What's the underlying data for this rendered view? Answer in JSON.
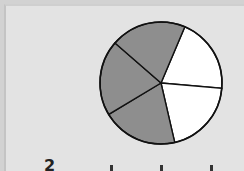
{
  "chart_data": {
    "type": "pie",
    "title": "",
    "total_parts": 5,
    "shaded_parts": 3,
    "fraction_shaded": "3/5",
    "slices": [
      {
        "label": "part 1",
        "value": 1,
        "shaded": false,
        "color": "#ffffff"
      },
      {
        "label": "part 2",
        "value": 1,
        "shaded": false,
        "color": "#ffffff"
      },
      {
        "label": "part 3",
        "value": 1,
        "shaded": true,
        "color": "#8e8e8e"
      },
      {
        "label": "part 4",
        "value": 1,
        "shaded": true,
        "color": "#8e8e8e"
      },
      {
        "label": "part 5",
        "value": 1,
        "shaded": true,
        "color": "#8e8e8e"
      }
    ],
    "legend": null
  },
  "caption": {
    "text": "2"
  },
  "colors": {
    "background": "#e3e3e3",
    "shaded": "#8e8e8e",
    "unshaded": "#ffffff",
    "outline": "#111111"
  }
}
